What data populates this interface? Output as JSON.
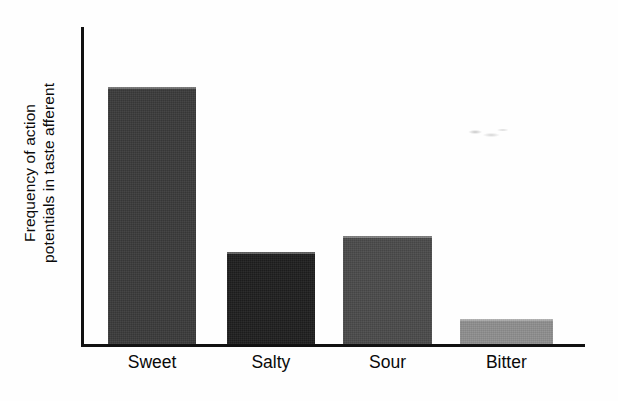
{
  "figure": {
    "background_color": "#fefefe",
    "axis_color": "#111111"
  },
  "axis_labels": {
    "y_line1": "Frequency of action",
    "y_line2": "potentials in taste afferent"
  },
  "chart_data": {
    "type": "bar",
    "title": "",
    "subtitle": "",
    "xlabel": "",
    "ylabel": "Frequency of action potentials in taste afferent",
    "categories": [
      "Sweet",
      "Salty",
      "Sour",
      "Bitter"
    ],
    "values": [
      81,
      29,
      34,
      8
    ],
    "value_unit": "relative (percent of axis height)",
    "ylim": [
      0,
      100
    ],
    "axis_ticks_shown": false,
    "y_tick_labels": [],
    "grid": false,
    "legend": false,
    "legend_position": "none",
    "annotations": [],
    "bar_colors": [
      "#3a3a3a",
      "#1e1e1e",
      "#4a4a4a",
      "#8e8e8e"
    ],
    "bars": [
      {
        "label": "Sweet",
        "value": 81,
        "color": "#3a3a3a",
        "left_pct": 4.8,
        "width_pct": 17.6
      },
      {
        "label": "Salty",
        "value": 29,
        "color": "#1e1e1e",
        "left_pct": 28.5,
        "width_pct": 17.6
      },
      {
        "label": "Sour",
        "value": 34,
        "color": "#4a4a4a",
        "left_pct": 51.7,
        "width_pct": 17.8
      },
      {
        "label": "Bitter",
        "value": 8,
        "color": "#8e8e8e",
        "left_pct": 75.0,
        "width_pct": 18.6
      }
    ]
  }
}
